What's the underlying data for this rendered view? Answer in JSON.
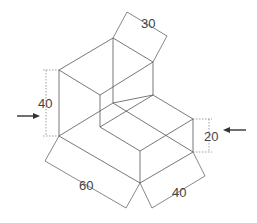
{
  "figure": {
    "type": "isometric-technical-drawing"
  },
  "dimensions": {
    "top_depth": "30",
    "left_height": "40",
    "right_step_height": "20",
    "bottom_length": "60",
    "bottom_width": "40"
  },
  "view_arrows": {
    "left": "view-direction-arrow-right",
    "right": "view-direction-arrow-left"
  },
  "colors": {
    "line": "#555555",
    "text": "#444444"
  }
}
